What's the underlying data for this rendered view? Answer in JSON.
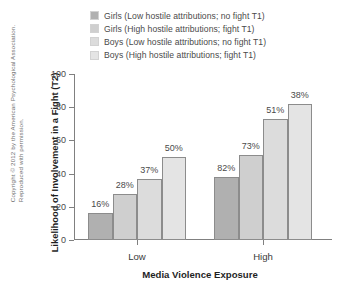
{
  "copyright": "Copyright © 2012 by the American Psychological Association. Reproduced with permission.",
  "legend": {
    "entries": [
      {
        "label": "Girls (Low hostile attributions; no fight T1)",
        "color": "#b0b0b0"
      },
      {
        "label": "Girls (High hostile attributions; fight T1)",
        "color": "#cfcfcf"
      },
      {
        "label": "Boys (Low hostile attributions; no fight T1)",
        "color": "#dcdcdc"
      },
      {
        "label": "Boys (High hostile attributions; fight T1)",
        "color": "#e4e4e4"
      }
    ]
  },
  "chart_data": {
    "type": "bar",
    "title": "",
    "xlabel": "Media Violence Exposure",
    "ylabel": "Likelihood of Involvement in a Fight (T2)",
    "categories": [
      "Low",
      "High"
    ],
    "ylim": [
      0,
      100
    ],
    "yticks": [
      0,
      20,
      40,
      60,
      80,
      100
    ],
    "grid": false,
    "legend_position": "top",
    "series": [
      {
        "name": "Girls (Low hostile attributions; no fight T1)",
        "color": "#b0b0b0",
        "values": [
          16,
          38
        ],
        "labels": [
          "16%",
          "82%"
        ]
      },
      {
        "name": "Girls (High hostile attributions; fight T1)",
        "color": "#cfcfcf",
        "values": [
          28,
          51
        ],
        "labels": [
          "28%",
          "73%"
        ]
      },
      {
        "name": "Boys (Low hostile attributions; no fight T1)",
        "color": "#dcdcdc",
        "values": [
          37,
          73
        ],
        "labels": [
          "37%",
          "51%"
        ]
      },
      {
        "name": "Boys (High hostile attributions; fight T1)",
        "color": "#e4e4e4",
        "values": [
          50,
          82
        ],
        "labels": [
          "50%",
          "38%"
        ]
      }
    ]
  }
}
